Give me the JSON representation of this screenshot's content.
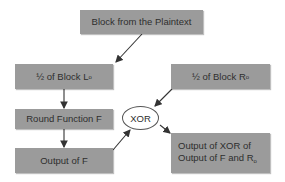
{
  "diagram": {
    "nodes": {
      "plaintext_block": {
        "label": "Block from the Plaintext"
      },
      "left_half": {
        "label": "½ of Block L",
        "subscript": "o"
      },
      "right_half": {
        "label": "½ of Block R",
        "subscript": "o"
      },
      "round_function": {
        "label": "Round Function F"
      },
      "output_f": {
        "label": "Output of F"
      },
      "xor": {
        "label": "XOR"
      },
      "xor_output": {
        "line1": "Output of XOR of",
        "line2": "Output of F and R",
        "subscript": "o"
      }
    },
    "edges": [
      {
        "from": "plaintext_block",
        "to": "left_half"
      },
      {
        "from": "left_half",
        "to": "round_function"
      },
      {
        "from": "round_function",
        "to": "output_f"
      },
      {
        "from": "output_f",
        "to": "xor"
      },
      {
        "from": "right_half",
        "to": "xor"
      },
      {
        "from": "xor",
        "to": "xor_output"
      }
    ],
    "colors": {
      "box_fill": "#9b9b9b",
      "text": "#2e2e2e",
      "arrow": "#333333"
    }
  }
}
